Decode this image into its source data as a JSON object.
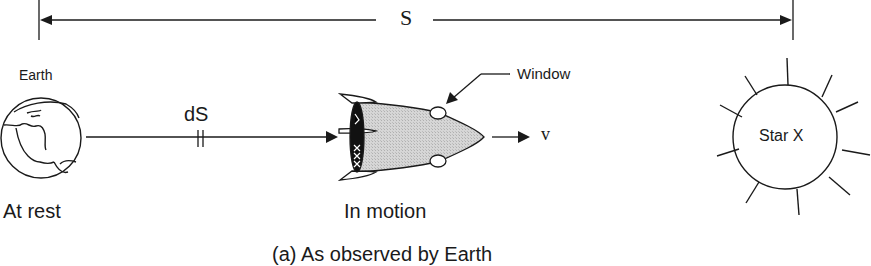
{
  "distance": {
    "label": "S"
  },
  "earth": {
    "name": "Earth",
    "state": "At rest"
  },
  "segment": {
    "label": "dS"
  },
  "rocket": {
    "state": "In motion",
    "window_label": "Window",
    "velocity_label": "v"
  },
  "star": {
    "label": "Star X"
  },
  "caption": "(a) As observed by Earth",
  "colors": {
    "ink": "#1a1a1a",
    "rocket_fill": "#cfcfcf",
    "background": "#ffffff"
  }
}
